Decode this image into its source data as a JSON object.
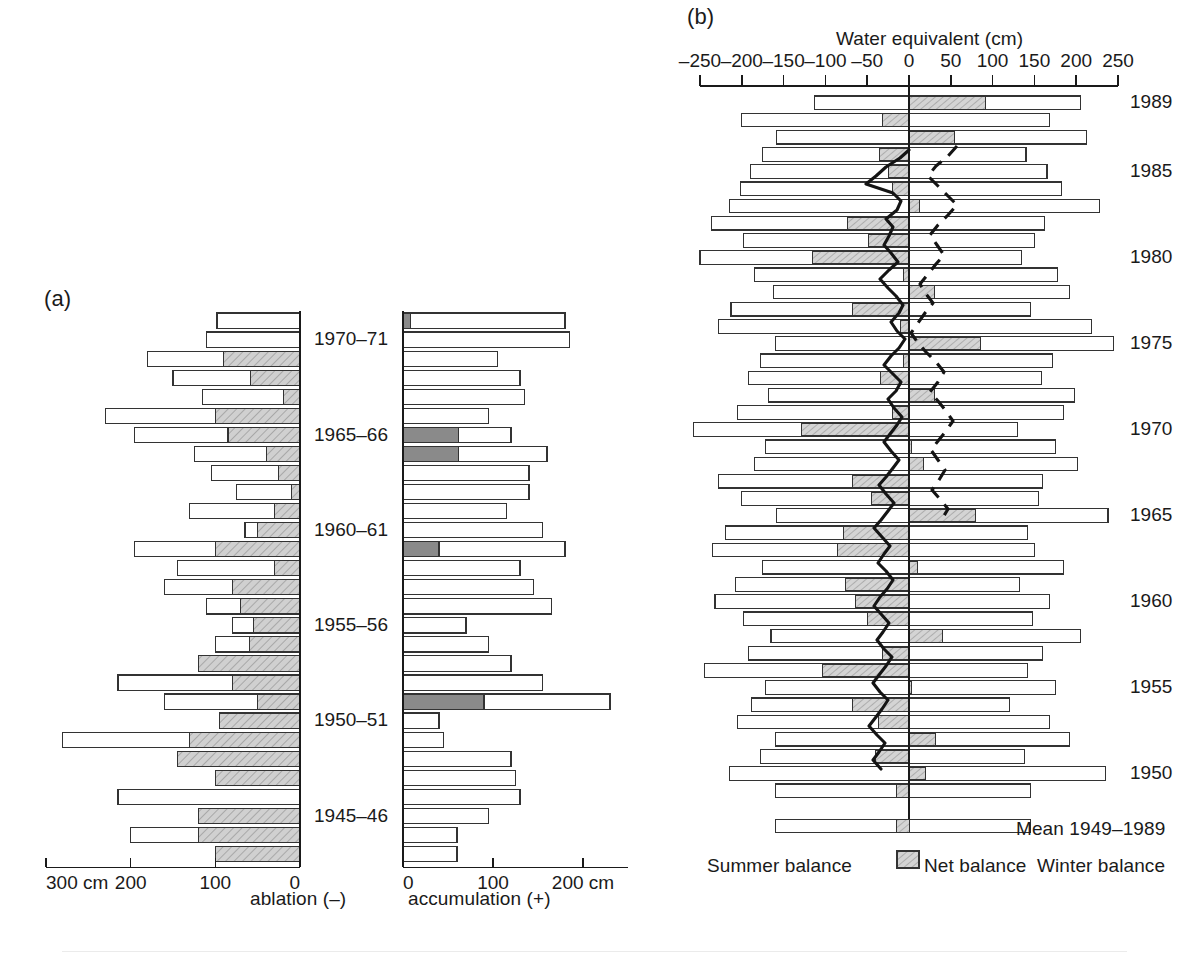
{
  "figure": {
    "panel_a_tag": "(a)",
    "panel_b_tag": "(b)"
  },
  "panel_a": {
    "left_axis_title": "ablation (–)",
    "right_axis_title": "accumulation (+)",
    "left_ticks": [
      "300 cm",
      "200",
      "100",
      "0"
    ],
    "right_ticks": [
      "0",
      "100",
      "200 cm"
    ],
    "year_labels": [
      "1970–71",
      "1965–66",
      "1960–61",
      "1955–56",
      "1950–51",
      "1945–46"
    ],
    "left_axis_max": 300,
    "right_axis_max": 250
  },
  "panel_b": {
    "axis_title": "Water equivalent (cm)",
    "ticks": [
      "–250",
      "–200",
      "–150",
      "–100",
      "–50",
      "0",
      "50",
      "100",
      "150",
      "200",
      "250"
    ],
    "tick_values": [
      -250,
      -200,
      -150,
      -100,
      -50,
      0,
      50,
      100,
      150,
      200,
      250
    ],
    "year_labels": [
      "1989",
      "1985",
      "1980",
      "1975",
      "1970",
      "1965",
      "1960",
      "1955",
      "1950"
    ],
    "mean_label": "Mean 1949–1989",
    "legend": {
      "summer": "Summer balance",
      "net": "Net balance",
      "winter": "Winter balance"
    }
  },
  "colors": {
    "ink": "#1a1a1a",
    "hatch_fill": "#c9c9c9",
    "solid_grey": "#8a8a8a",
    "bar_fill": "#ffffff",
    "stroke": "#333333"
  },
  "chart_data": [
    {
      "type": "bar",
      "id": "panel-a",
      "title": "(a) Annual ablation and accumulation",
      "orientation": "horizontal",
      "xlabel_left": "ablation (–)",
      "xlabel_right": "accumulation (+)",
      "ylabel": "",
      "grid": false,
      "legend": "none",
      "xlim_left": [
        0,
        300
      ],
      "xlim_right": [
        0,
        250
      ],
      "categories": [
        "1944–45",
        "1945–46",
        "1946–47",
        "1947–48",
        "1948–49",
        "1949–50",
        "1950–51",
        "1951–52",
        "1952–53",
        "1953–54",
        "1954–55",
        "1955–56",
        "1956–57",
        "1957–58",
        "1958–59",
        "1959–60",
        "1960–61",
        "1961–62",
        "1962–63",
        "1963–64",
        "1964–65",
        "1965–66",
        "1966–67",
        "1967–68",
        "1968–69",
        "1969–70",
        "1970–71",
        "1971–72",
        "1972–73"
      ],
      "series": [
        {
          "name": "ablation_total",
          "axis": "left",
          "values": [
            100,
            200,
            120,
            215,
            100,
            145,
            280,
            95,
            160,
            215,
            120,
            100,
            80,
            110,
            160,
            145,
            195,
            65,
            130,
            75,
            105,
            125,
            195,
            230,
            115,
            150,
            180,
            110,
            98
          ]
        },
        {
          "name": "ablation_hatched_portion",
          "axis": "left",
          "note": "hatched grey sub-bar measured from 0 outward",
          "values": [
            100,
            120,
            120,
            0,
            100,
            145,
            130,
            95,
            50,
            80,
            120,
            60,
            55,
            70,
            80,
            30,
            100,
            50,
            30,
            10,
            25,
            40,
            85,
            100,
            20,
            58,
            90,
            0,
            0
          ]
        },
        {
          "name": "accumulation_total",
          "axis": "right",
          "values": [
            60,
            60,
            95,
            130,
            125,
            120,
            45,
            40,
            230,
            155,
            120,
            95,
            70,
            165,
            145,
            130,
            180,
            155,
            115,
            140,
            140,
            160,
            120,
            95,
            135,
            130,
            105,
            185,
            180
          ]
        },
        {
          "name": "accumulation_solid_portion",
          "axis": "right",
          "note": "dark solid grey sub-bar at left end",
          "values": [
            0,
            0,
            0,
            0,
            0,
            0,
            0,
            0,
            90,
            0,
            0,
            0,
            0,
            0,
            0,
            0,
            40,
            0,
            0,
            0,
            0,
            62,
            62,
            0,
            0,
            0,
            0,
            0,
            8
          ]
        }
      ]
    },
    {
      "type": "bar",
      "id": "panel-b",
      "title": "(b) Winter, summer and net balance",
      "orientation": "horizontal",
      "xlabel": "Water equivalent (cm)",
      "ylabel": "",
      "grid": false,
      "xlim": [
        -250,
        250
      ],
      "legend_entries": [
        "Summer balance",
        "Net balance",
        "Winter balance"
      ],
      "legend_position": "bottom",
      "categories": [
        1989,
        1988,
        1987,
        1986,
        1985,
        1984,
        1983,
        1982,
        1981,
        1980,
        1979,
        1978,
        1977,
        1976,
        1975,
        1974,
        1973,
        1972,
        1971,
        1970,
        1969,
        1968,
        1967,
        1966,
        1965,
        1964,
        1963,
        1962,
        1961,
        1960,
        1959,
        1958,
        1957,
        1956,
        1955,
        1954,
        1953,
        1952,
        1951,
        1950,
        1949
      ],
      "series": [
        {
          "name": "Summer balance",
          "note": "negative extent, cm w.e.",
          "values": [
            -113,
            -200,
            -158,
            -175,
            -190,
            -202,
            -215,
            -236,
            -198,
            -250,
            -185,
            -162,
            -213,
            -228,
            -160,
            -178,
            -192,
            -168,
            -205,
            -258,
            -172,
            -185,
            -228,
            -200,
            -158,
            -220,
            -235,
            -175,
            -208,
            -232,
            -198,
            -165,
            -192,
            -245,
            -172,
            -188,
            -205,
            -160,
            -178,
            -215,
            -160
          ]
        },
        {
          "name": "Winter balance",
          "note": "positive extent, cm w.e.",
          "values": [
            205,
            168,
            212,
            140,
            165,
            182,
            228,
            162,
            150,
            135,
            178,
            192,
            145,
            218,
            245,
            172,
            158,
            198,
            185,
            130,
            175,
            202,
            160,
            155,
            238,
            142,
            150,
            185,
            132,
            168,
            148,
            205,
            160,
            142,
            175,
            120,
            168,
            192,
            138,
            235,
            145
          ]
        },
        {
          "name": "Net balance",
          "note": "winter + summer; hatched band",
          "values": [
            92,
            -32,
            54,
            -35,
            -25,
            -20,
            13,
            -74,
            -48,
            -115,
            -7,
            30,
            -68,
            -10,
            85,
            -6,
            -34,
            30,
            -20,
            -128,
            3,
            17,
            -68,
            -45,
            80,
            -78,
            -85,
            10,
            -76,
            -64,
            -50,
            40,
            -32,
            -103,
            3,
            -68,
            -37,
            32,
            -40,
            20,
            -15
          ]
        }
      ],
      "overlays": [
        {
          "name": "cumulative-net-balance-solid",
          "style": "solid",
          "note": "thick solid curve, 1950–1987"
        },
        {
          "name": "cumulative-net-balance-dashed",
          "style": "dashed",
          "note": "dashed curve, 1965–1988"
        }
      ],
      "mean_row": {
        "label": "Mean 1949–1989",
        "summer": -160,
        "winter": 145,
        "net": -15
      }
    }
  ]
}
